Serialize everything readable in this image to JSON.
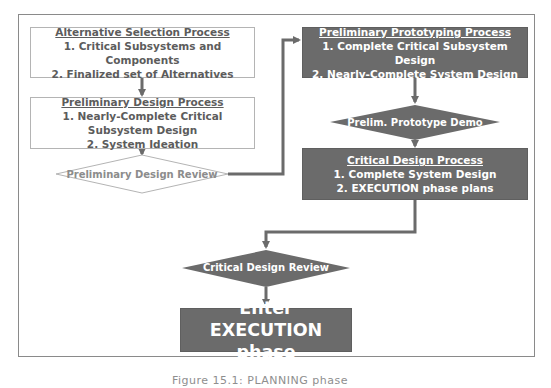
{
  "diagram": {
    "type": "flowchart",
    "nodes": {
      "alternative_selection": {
        "shape": "rectangle",
        "style": "light",
        "title": "Alternative Selection Process",
        "lines": [
          "1. Critical Subsystems and Components",
          "2. Finalized set of Alternatives"
        ]
      },
      "preliminary_design": {
        "shape": "rectangle",
        "style": "light",
        "title": "Preliminary Design Process",
        "lines": [
          "1. Nearly-Complete Critical Subsystem Design",
          "2. System Ideation"
        ]
      },
      "preliminary_design_review": {
        "shape": "diamond",
        "style": "light",
        "label": "Preliminary Design Review"
      },
      "preliminary_prototyping": {
        "shape": "rectangle",
        "style": "dark",
        "title": "Preliminary Prototyping Process",
        "lines": [
          "1. Complete Critical Subsystem Design",
          "2. Nearly-Complete System Design"
        ]
      },
      "prelim_prototype_demo": {
        "shape": "diamond",
        "style": "dark",
        "label": "Prelim. Prototype Demo"
      },
      "critical_design": {
        "shape": "rectangle",
        "style": "dark",
        "title": "Critical Design Process",
        "lines": [
          "1. Complete System Design",
          "2. EXECUTION phase plans"
        ]
      },
      "critical_design_review": {
        "shape": "diamond",
        "style": "dark",
        "label": "Critical Design Review"
      },
      "enter_execution": {
        "shape": "rectangle",
        "style": "dark",
        "label": "Enter EXECUTION phase"
      }
    },
    "edges": [
      [
        "alternative_selection",
        "preliminary_design"
      ],
      [
        "preliminary_design",
        "preliminary_design_review"
      ],
      [
        "preliminary_design_review",
        "preliminary_prototyping"
      ],
      [
        "preliminary_prototyping",
        "prelim_prototype_demo"
      ],
      [
        "prelim_prototype_demo",
        "critical_design"
      ],
      [
        "critical_design",
        "critical_design_review"
      ],
      [
        "critical_design_review",
        "enter_execution"
      ]
    ],
    "colors": {
      "dark_fill": "#6b6b6b",
      "light_border": "#b4b4b4",
      "connector": "#6b6b6b",
      "light_text": "#5c5c5c",
      "frame_border": "#8a8a8a"
    }
  },
  "caption": "Figure 15.1: PLANNING phase"
}
